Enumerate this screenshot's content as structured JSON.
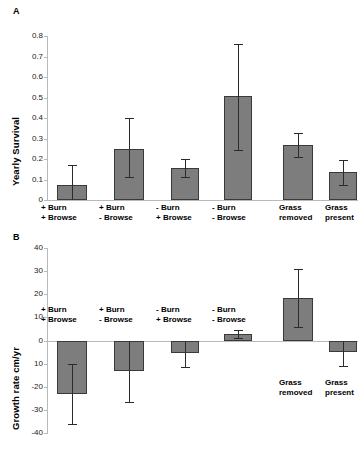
{
  "figure": {
    "panels": [
      {
        "letter": "A",
        "ylabel": "Yearly Survival",
        "yticks": [
          "0.8",
          "0.7",
          "0.6",
          "0.5",
          "0.4",
          "0.3",
          "0.2",
          "0.1",
          "0"
        ]
      },
      {
        "letter": "B",
        "ylabel": "Growth rate cm/yr",
        "yticks": [
          "40",
          "30",
          "20",
          "10",
          "0",
          "10",
          "-20",
          "-30",
          "-40"
        ]
      }
    ],
    "categories": [
      {
        "line1": "+ Burn",
        "line2": "+ Browse"
      },
      {
        "line1": "+ Burn",
        "line2": "- Browse"
      },
      {
        "line1": "- Burn",
        "line2": "+ Browse"
      },
      {
        "line1": "- Burn",
        "line2": "- Browse"
      },
      {
        "line1": "Grass",
        "line2": "removed"
      },
      {
        "line1": "Grass",
        "line2": "present"
      }
    ],
    "colors": {
      "bar_fill": "#7d7d7d",
      "bar_stroke": "#3a3a3a",
      "axis": "#b9b9b9",
      "error": "#2b2b2b"
    }
  },
  "chart_data": [
    {
      "type": "bar",
      "title": "A",
      "xlabel": "",
      "ylabel": "Yearly Survival",
      "ylim": [
        0,
        0.8
      ],
      "ytick_values": [
        0,
        0.1,
        0.2,
        0.3,
        0.4,
        0.5,
        0.6,
        0.7,
        0.8
      ],
      "ytick_labels": [
        "0",
        "0.1",
        "0.2",
        "0.3",
        "0.4",
        "0.5",
        "0.6",
        "0.7",
        "0.8"
      ],
      "grid": false,
      "legend": "none",
      "categories": [
        "+ Burn / + Browse",
        "+ Burn / - Browse",
        "- Burn / + Browse",
        "- Burn / - Browse",
        "Grass removed",
        "Grass present"
      ],
      "values": [
        0.075,
        0.25,
        0.155,
        0.505,
        0.27,
        0.135
      ],
      "error_low": [
        0.0,
        0.11,
        0.11,
        0.245,
        0.21,
        0.075
      ],
      "error_high": [
        0.17,
        0.4,
        0.2,
        0.76,
        0.325,
        0.195
      ]
    },
    {
      "type": "bar",
      "title": "B",
      "xlabel": "",
      "ylabel": "Growth rate cm/yr",
      "ylim": [
        -40,
        40
      ],
      "ytick_values": [
        40,
        30,
        20,
        10,
        0,
        -10,
        -20,
        -30,
        -40
      ],
      "ytick_labels": [
        "40",
        "30",
        "20",
        "10",
        "0",
        "10",
        "-20",
        "-30",
        "-40"
      ],
      "grid": false,
      "legend": "none",
      "categories": [
        "+ Burn / + Browse",
        "+ Burn / - Browse",
        "- Burn / + Browse",
        "- Burn / - Browse",
        "Grass removed",
        "Grass present"
      ],
      "values": [
        -23,
        -13,
        -5.5,
        3,
        18.5,
        -5
      ],
      "error_low": [
        -36,
        -26.5,
        -11.5,
        1,
        6,
        -11
      ],
      "error_high": [
        -10,
        0,
        0,
        4.5,
        31,
        0
      ]
    }
  ]
}
